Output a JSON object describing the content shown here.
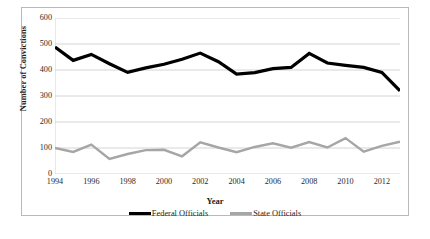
{
  "chart_data": {
    "type": "line",
    "title": "",
    "xlabel": "Year",
    "ylabel": "Number of Convictions",
    "x": [
      1994,
      1995,
      1996,
      1997,
      1998,
      1999,
      2000,
      2001,
      2002,
      2003,
      2004,
      2005,
      2006,
      2007,
      2008,
      2009,
      2010,
      2011,
      2012,
      2013
    ],
    "xlim": [
      1994,
      2013
    ],
    "ylim": [
      0,
      600
    ],
    "xtick_labels": [
      "1994",
      "1996",
      "1998",
      "2000",
      "2002",
      "2004",
      "2006",
      "2008",
      "2010",
      "2012"
    ],
    "xtick_values": [
      1994,
      1996,
      1998,
      2000,
      2002,
      2004,
      2006,
      2008,
      2010,
      2012
    ],
    "ytick_labels": [
      "0",
      "100",
      "200",
      "300",
      "400",
      "500",
      "600"
    ],
    "ytick_values": [
      0,
      100,
      200,
      300,
      400,
      500,
      600
    ],
    "grid": "horizontal",
    "legend_position": "bottom",
    "series": [
      {
        "name": "Federal Officials",
        "color": "#000000",
        "width": 3.2,
        "values": [
          488,
          437,
          460,
          424,
          391,
          408,
          422,
          441,
          465,
          432,
          384,
          390,
          405,
          410,
          464,
          427,
          418,
          410,
          391,
          320
        ]
      },
      {
        "name": "State Officials",
        "color": "#a6a6a6",
        "width": 2.4,
        "values": [
          100,
          85,
          113,
          58,
          77,
          92,
          93,
          68,
          122,
          102,
          84,
          104,
          118,
          101,
          123,
          102,
          138,
          86,
          108,
          124
        ]
      }
    ]
  },
  "axes": {
    "y_title": "Number of Convictions",
    "x_title": "Year"
  },
  "legend": {
    "items": [
      {
        "label": "Federal Officials",
        "color": "#000000"
      },
      {
        "label": "State Officials",
        "color": "#a6a6a6"
      }
    ]
  }
}
